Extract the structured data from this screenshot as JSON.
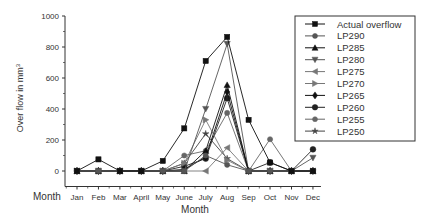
{
  "chart_data": {
    "type": "line",
    "title": "",
    "xlabel": "Month",
    "ylabel": "Over flow in mm³",
    "ylabel_base": "Over flow in mm",
    "ylabel_sup": "3",
    "ylim": [
      -100,
      1000
    ],
    "yticks": [
      0,
      200,
      400,
      600,
      800,
      1000
    ],
    "ytick_labels": [
      "0",
      "200",
      "400",
      "600",
      "800",
      "1000"
    ],
    "x_axis_start_label": "Month",
    "categories": [
      "Jan",
      "Feb",
      "Mar",
      "April",
      "May",
      "June",
      "July",
      "Aug",
      "Sep",
      "Oct",
      "Nov",
      "Dec"
    ],
    "grid": false,
    "legend_position": "upper right",
    "series": [
      {
        "name": "Actual overflow",
        "marker": "square",
        "color": "#111111",
        "values": [
          0,
          75,
          0,
          0,
          65,
          275,
          710,
          865,
          330,
          55,
          0,
          0
        ]
      },
      {
        "name": "LP290",
        "marker": "circle",
        "color": "#555555",
        "values": [
          0,
          0,
          0,
          0,
          0,
          0,
          100,
          40,
          0,
          0,
          0,
          0
        ]
      },
      {
        "name": "LP285",
        "marker": "triangle-up",
        "color": "#111111",
        "values": [
          0,
          0,
          0,
          0,
          0,
          0,
          130,
          555,
          0,
          0,
          0,
          0
        ]
      },
      {
        "name": "LP280",
        "marker": "triangle-down",
        "color": "#555555",
        "values": [
          0,
          0,
          0,
          0,
          0,
          0,
          400,
          820,
          0,
          0,
          0,
          85
        ]
      },
      {
        "name": "LP275",
        "marker": "triangle-left",
        "color": "#777777",
        "values": [
          0,
          0,
          0,
          0,
          0,
          0,
          0,
          150,
          0,
          0,
          0,
          0
        ]
      },
      {
        "name": "LP270",
        "marker": "triangle-right",
        "color": "#777777",
        "values": [
          0,
          0,
          0,
          0,
          0,
          50,
          330,
          70,
          0,
          0,
          0,
          0
        ]
      },
      {
        "name": "LP265",
        "marker": "diamond",
        "color": "#111111",
        "values": [
          0,
          0,
          0,
          0,
          0,
          10,
          90,
          510,
          0,
          0,
          0,
          0
        ]
      },
      {
        "name": "LP260",
        "marker": "hexagon",
        "color": "#222222",
        "values": [
          0,
          0,
          0,
          0,
          0,
          30,
          80,
          470,
          0,
          55,
          0,
          140
        ]
      },
      {
        "name": "LP255",
        "marker": "circle",
        "color": "#666666",
        "values": [
          0,
          0,
          0,
          0,
          0,
          100,
          130,
          375,
          0,
          205,
          0,
          0
        ]
      },
      {
        "name": "LP250",
        "marker": "star",
        "color": "#444444",
        "values": [
          0,
          0,
          0,
          0,
          0,
          50,
          240,
          80,
          0,
          0,
          0,
          0
        ]
      }
    ]
  }
}
